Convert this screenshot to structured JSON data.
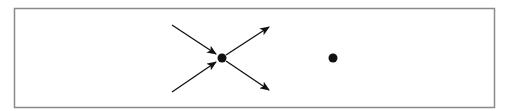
{
  "diagram": {
    "type": "node-arrow-diagram",
    "frame": {
      "x": 14.5,
      "y": 8.5,
      "width": 480,
      "height": 99,
      "stroke": "#8a8a8a"
    },
    "colors": {
      "ink": "#111111",
      "background": "#ffffff"
    },
    "nodes": [
      {
        "id": "center-node",
        "x": 222,
        "y": 58,
        "r": 4.5
      },
      {
        "id": "isolated-node",
        "x": 333,
        "y": 58,
        "r": 4.5
      }
    ],
    "arrows": [
      {
        "id": "incoming-upper-left",
        "direction": "incoming",
        "x1": 172,
        "y1": 25,
        "x2": 216,
        "y2": 54
      },
      {
        "id": "incoming-lower-left",
        "direction": "incoming",
        "x1": 172,
        "y1": 92,
        "x2": 216,
        "y2": 62
      },
      {
        "id": "outgoing-upper-right",
        "direction": "outgoing",
        "x1": 226,
        "y1": 55,
        "x2": 269,
        "y2": 27
      },
      {
        "id": "outgoing-lower-right",
        "direction": "outgoing",
        "x1": 226,
        "y1": 61,
        "x2": 269,
        "y2": 90
      }
    ]
  }
}
